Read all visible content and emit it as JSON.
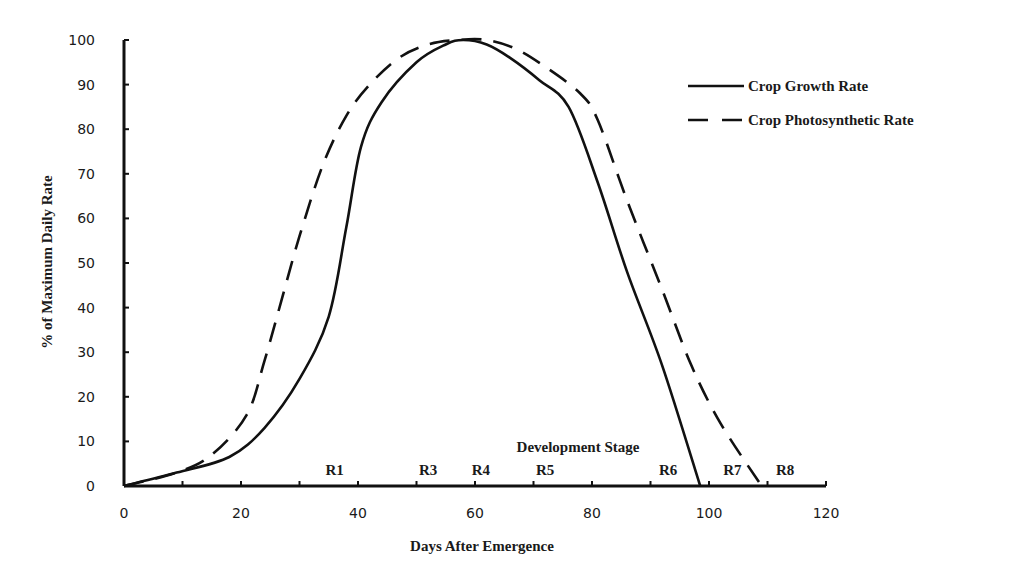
{
  "chart_data": {
    "type": "line",
    "title": "",
    "xlabel": "Days After Emergence",
    "ylabel": "% of Maximum Daily Rate",
    "xlim": [
      0,
      120
    ],
    "ylim": [
      0,
      100
    ],
    "x_ticks": [
      0,
      20,
      40,
      60,
      80,
      100,
      120
    ],
    "x_minor_ticks": [
      10,
      30,
      50,
      70,
      90,
      110
    ],
    "y_ticks": [
      0,
      10,
      20,
      30,
      40,
      50,
      60,
      70,
      80,
      90,
      100
    ],
    "grid": false,
    "legend_position": "top-right",
    "series": [
      {
        "name": "Crop Growth Rate",
        "style": "solid",
        "x": [
          0,
          9,
          18,
          24,
          30,
          35,
          38,
          40.5,
          44,
          50,
          55,
          58,
          62,
          66,
          71,
          76,
          81,
          86,
          92,
          98.5
        ],
        "y": [
          0,
          3,
          6.5,
          13,
          24,
          38,
          58,
          76,
          86,
          95,
          99,
          100,
          99,
          96,
          91,
          85,
          68,
          48,
          27,
          0
        ]
      },
      {
        "name": "Crop Photosynthetic Rate",
        "style": "dashed",
        "x": [
          0,
          9,
          15,
          21,
          24,
          27,
          30,
          34,
          38,
          42,
          47,
          52,
          57,
          62,
          67,
          72,
          78,
          81,
          86,
          92,
          97,
          102,
          109
        ],
        "y": [
          0,
          3,
          7,
          16,
          28,
          42,
          56,
          72,
          83,
          90,
          96,
          99,
          100,
          100,
          98,
          94,
          88,
          82,
          64,
          44,
          27,
          14,
          0
        ]
      }
    ],
    "annotations": {
      "stage_title": "Development Stage",
      "stages": [
        {
          "label": "R1",
          "x": 36
        },
        {
          "label": "R3",
          "x": 52
        },
        {
          "label": "R4",
          "x": 61
        },
        {
          "label": "R5",
          "x": 72
        },
        {
          "label": "R6",
          "x": 93
        },
        {
          "label": "R7",
          "x": 104
        },
        {
          "label": "R8",
          "x": 113
        }
      ]
    },
    "colors": {
      "line": "#111111",
      "axis": "#111111"
    }
  }
}
